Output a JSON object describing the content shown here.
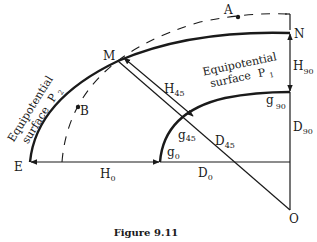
{
  "figure": {
    "caption": "Figure 9.11",
    "points": {
      "A": "A",
      "B": "B",
      "M": "M",
      "N": "N",
      "E": "E",
      "O": "O"
    },
    "surfaces": {
      "p1_line1": "Equipotential",
      "p1_line2": "surface",
      "p1_symbol": "P",
      "p1_sub": "1",
      "p2_line1": "Equipotential",
      "p2_line2": "surface",
      "p2_symbol": "P",
      "p2_sub": "2"
    },
    "heights": {
      "h45": "H",
      "h45_sub": "45",
      "h90": "H",
      "h90_sub": "90",
      "h0": "H",
      "h0_sub": "0"
    },
    "distances": {
      "d45": "D",
      "d45_sub": "45",
      "d90": "D",
      "d90_sub": "90",
      "d0": "D",
      "d0_sub": "0"
    },
    "gravity": {
      "g0": "g",
      "g0_sub": "0",
      "g45": "g",
      "g45_sub": "45",
      "g90": "g",
      "g90_sub": "90"
    }
  }
}
